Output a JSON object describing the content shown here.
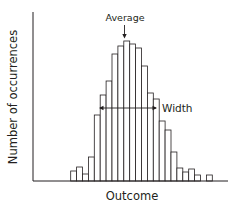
{
  "chart_data": {
    "type": "bar",
    "title": "",
    "xlabel": "Outcome",
    "ylabel": "Number of occurrences",
    "annotations": [
      {
        "text": "Average",
        "type": "arrow-down",
        "target_bin": 9
      },
      {
        "text": "Width",
        "type": "double-arrow",
        "from_bin": 4.8,
        "to_bin": 14.3
      }
    ],
    "categories": [
      "1",
      "2",
      "3",
      "4",
      "5",
      "6",
      "7",
      "8",
      "9",
      "10",
      "11",
      "12",
      "13",
      "14",
      "15",
      "16",
      "17",
      "18",
      "19",
      "20",
      "21",
      "22",
      "23",
      "24"
    ],
    "values": [
      10,
      14,
      7,
      24,
      66,
      86,
      100,
      127,
      135,
      140,
      137,
      133,
      115,
      88,
      82,
      60,
      51,
      29,
      13,
      9,
      12,
      6,
      0,
      6
    ],
    "ylim": [
      0,
      168
    ],
    "grid": false,
    "legend": null,
    "tick_labels": false
  },
  "labels": {
    "x": "Outcome",
    "y": "Number of occurrences",
    "average": "Average",
    "width": "Width"
  },
  "colors": {
    "ink": "#231f20",
    "bar_fill": "#ffffff"
  }
}
